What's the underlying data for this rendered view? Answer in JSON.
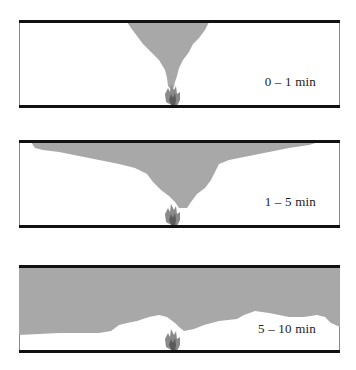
{
  "diagram": {
    "colors": {
      "smoke": "#a8a8a8",
      "wall": "#111111",
      "flame_outer": "#8a8a8a",
      "flame_inner": "#5a5a5a"
    },
    "panels": [
      {
        "label": "0 – 1 min",
        "stage": "plume rising, small ceiling jet"
      },
      {
        "label": "1 – 5 min",
        "stage": "smoke spreads along ceiling"
      },
      {
        "label": "5 – 10 min",
        "stage": "thick smoke layer descends"
      }
    ]
  }
}
